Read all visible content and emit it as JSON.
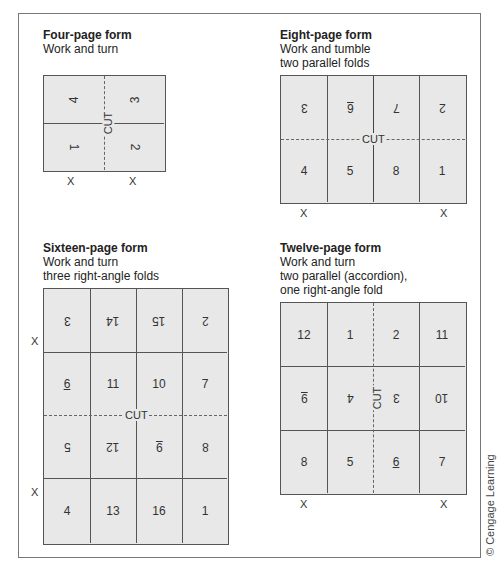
{
  "forms": {
    "four": {
      "title": "Four-page form",
      "subtitle_lines": [
        "Work and turn"
      ],
      "cut_label": "CUT",
      "x_marks": [
        "X",
        "X"
      ],
      "cells": [
        {
          "label": "4",
          "orientation": "rotated-ccw"
        },
        {
          "label": "3",
          "orientation": "rotated-ccw"
        },
        {
          "label": "1",
          "orientation": "rotated-cw"
        },
        {
          "label": "2",
          "orientation": "rotated-cw"
        }
      ]
    },
    "eight": {
      "title": "Eight-page form",
      "subtitle_lines": [
        "Work and tumble",
        "two parallel folds"
      ],
      "cut_label": "CUT",
      "x_marks": [
        "X",
        "X"
      ],
      "rows": [
        [
          {
            "label": "3",
            "inverted": true
          },
          {
            "label": "6",
            "inverted": true,
            "underline": true
          },
          {
            "label": "7",
            "inverted": true
          },
          {
            "label": "2",
            "inverted": true
          }
        ],
        [
          {
            "label": "4"
          },
          {
            "label": "5"
          },
          {
            "label": "8"
          },
          {
            "label": "1"
          }
        ]
      ]
    },
    "sixteen": {
      "title": "Sixteen-page form",
      "subtitle_lines": [
        "Work and turn",
        "three right-angle folds"
      ],
      "cut_label": "CUT",
      "x_marks": [
        "X",
        "X"
      ],
      "rows": [
        [
          {
            "label": "3",
            "inverted": true
          },
          {
            "label": "14",
            "inverted": true
          },
          {
            "label": "15",
            "inverted": true
          },
          {
            "label": "2",
            "inverted": true
          }
        ],
        [
          {
            "label": "6",
            "underline": true
          },
          {
            "label": "11"
          },
          {
            "label": "10"
          },
          {
            "label": "7"
          }
        ],
        [
          {
            "label": "5",
            "inverted": true
          },
          {
            "label": "12",
            "inverted": true
          },
          {
            "label": "9",
            "inverted": true,
            "underline": true
          },
          {
            "label": "8",
            "inverted": true
          }
        ],
        [
          {
            "label": "4"
          },
          {
            "label": "13"
          },
          {
            "label": "16"
          },
          {
            "label": "1"
          }
        ]
      ]
    },
    "twelve": {
      "title": "Twelve-page form",
      "subtitle_lines": [
        "Work and turn",
        "two parallel (accordion),",
        "one right-angle fold"
      ],
      "cut_label": "CUT",
      "x_marks": [
        "X",
        "X"
      ],
      "rows": [
        [
          {
            "label": "12"
          },
          {
            "label": "1"
          },
          {
            "label": "2"
          },
          {
            "label": "11"
          }
        ],
        [
          {
            "label": "9",
            "inverted": true,
            "underline": true
          },
          {
            "label": "4",
            "inverted": true
          },
          {
            "label": "3",
            "inverted": true
          },
          {
            "label": "10",
            "inverted": true
          }
        ],
        [
          {
            "label": "8"
          },
          {
            "label": "5"
          },
          {
            "label": "6",
            "underline": true
          },
          {
            "label": "7"
          }
        ]
      ]
    }
  },
  "copyright": "© Cengage Learning",
  "colors": {
    "cell_fill": "#e8e8e8",
    "line": "#555555",
    "frame": "#777777"
  }
}
